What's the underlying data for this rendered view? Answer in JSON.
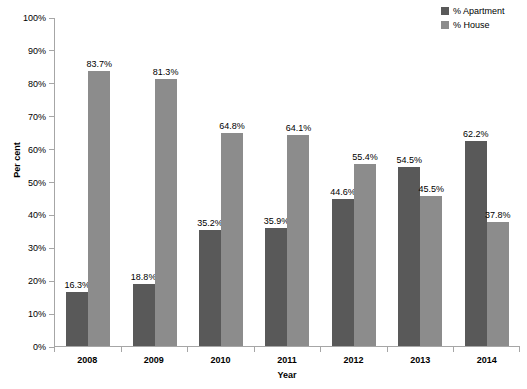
{
  "chart_data": {
    "type": "bar",
    "title": "",
    "xlabel": "Year",
    "ylabel": "Per cent",
    "categories": [
      "2008",
      "2009",
      "2010",
      "2011",
      "2012",
      "2013",
      "2014"
    ],
    "series": [
      {
        "name": "% Apartment",
        "color": "#595959",
        "values": [
          16.3,
          18.8,
          35.2,
          35.9,
          44.6,
          54.5,
          62.2
        ],
        "labels": [
          "16.3%",
          "18.8%",
          "35.2%",
          "35.9%",
          "44.6%",
          "54.5%",
          "62.2%"
        ]
      },
      {
        "name": "% House",
        "color": "#8c8c8c",
        "values": [
          83.7,
          81.3,
          64.8,
          64.1,
          55.4,
          45.5,
          37.8
        ],
        "labels": [
          "83.7%",
          "81.3%",
          "64.8%",
          "64.1%",
          "55.4%",
          "45.5%",
          "37.8%"
        ]
      }
    ],
    "ylim": [
      0,
      100
    ],
    "ytick_values": [
      0,
      10,
      20,
      30,
      40,
      50,
      60,
      70,
      80,
      90,
      100
    ],
    "ytick_labels": [
      "0%",
      "10%",
      "20%",
      "30%",
      "40%",
      "50%",
      "60%",
      "70%",
      "80%",
      "90%",
      "100%"
    ],
    "grid": false,
    "legend_position": "top-right",
    "axis_color": "#a6a6a6",
    "background": "#ffffff"
  }
}
